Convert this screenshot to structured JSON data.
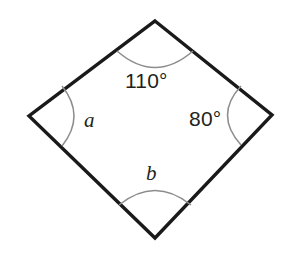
{
  "figure": {
    "kind": "quadrilateral-angle-diagram",
    "background_color": "#ffffff",
    "outline_color": "#1a1a1a",
    "arc_color": "#8d8d8d",
    "text_color": "#231f20",
    "vertices": {
      "top": {
        "x": 155,
        "y": 21
      },
      "right": {
        "x": 272,
        "y": 115
      },
      "bottom": {
        "x": 155,
        "y": 238
      },
      "left": {
        "x": 29,
        "y": 116
      }
    },
    "labels": {
      "top": "110°",
      "right": "80°",
      "left": "a",
      "bottom": "b"
    },
    "arcs": {
      "top": "arc-at-top-vertex",
      "right": "arc-at-right-vertex",
      "left": "arc-at-left-vertex",
      "bottom": "arc-at-bottom-vertex"
    }
  },
  "chart_data": {
    "type": "diagram",
    "title": "",
    "shape": "quadrilateral",
    "angles": [
      {
        "vertex": "top",
        "label": "110°",
        "value": 110,
        "known": true
      },
      {
        "vertex": "right",
        "label": "80°",
        "value": 80,
        "known": true
      },
      {
        "vertex": "left",
        "label": "a",
        "value": null,
        "known": false
      },
      {
        "vertex": "bottom",
        "label": "b",
        "value": null,
        "known": false
      }
    ],
    "angle_sum": 360
  }
}
